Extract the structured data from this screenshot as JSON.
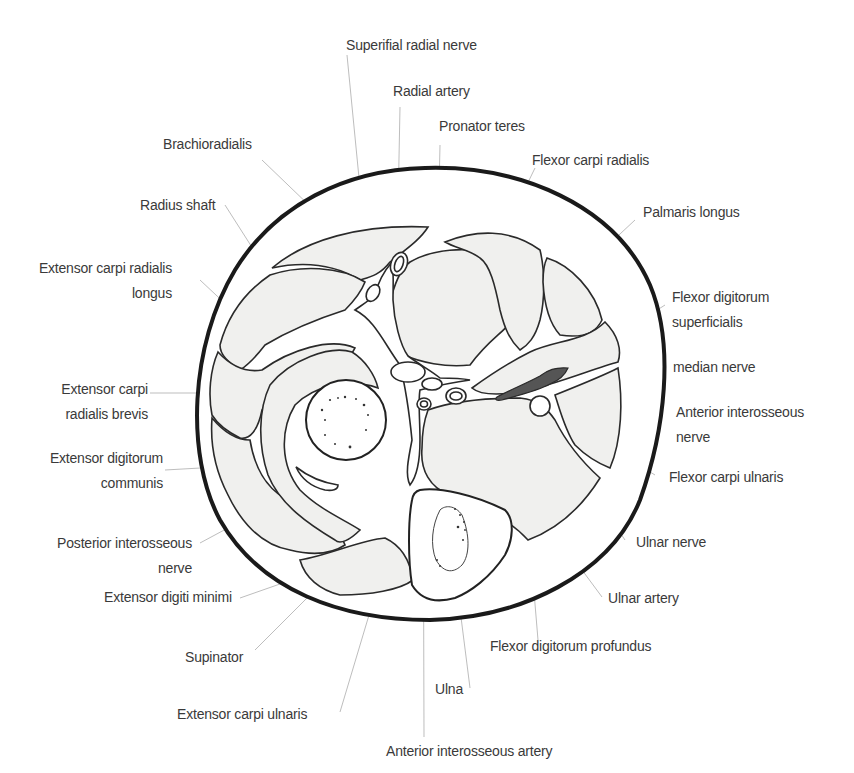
{
  "figure": {
    "type": "anatomical cross-section",
    "colors": {
      "outline": "#2a2a2a",
      "muscle_fill": "#f0f0ee",
      "label_text": "#3a3a3a",
      "leader_line": "#b5b5b5",
      "background": "#ffffff"
    }
  },
  "labels": {
    "superficial_radial_nerve": [
      "Superifial radial nerve"
    ],
    "radial_artery": [
      "Radial artery"
    ],
    "pronator_teres": [
      "Pronator teres"
    ],
    "brachioradialis": [
      "Brachioradialis"
    ],
    "flexor_carpi_radialis": [
      "Flexor carpi radialis"
    ],
    "radius_shaft": [
      "Radius shaft"
    ],
    "palmaris_longus": [
      "Palmaris longus"
    ],
    "ecrl": [
      "Extensor carpi radialis",
      "longus"
    ],
    "fds": [
      "Flexor digitorum",
      "superficialis"
    ],
    "median_nerve": [
      "median nerve"
    ],
    "ecrb": [
      "Extensor carpi",
      "radialis brevis"
    ],
    "anterior_interosseous_nerve": [
      "Anterior interosseous",
      "nerve"
    ],
    "edc": [
      "Extensor digitorum",
      "communis"
    ],
    "flexor_carpi_ulnaris": [
      "Flexor carpi ulnaris"
    ],
    "posterior_interosseous_nerve": [
      "Posterior interosseous",
      "nerve"
    ],
    "ulnar_nerve": [
      "Ulnar nerve"
    ],
    "extensor_digiti_minimi": [
      "Extensor digiti minimi"
    ],
    "ulnar_artery": [
      "Ulnar artery"
    ],
    "supinator": [
      "Supinator"
    ],
    "fdp": [
      "Flexor digitorum profundus"
    ],
    "ulna": [
      "Ulna"
    ],
    "extensor_carpi_ulnaris": [
      "Extensor carpi ulnaris"
    ],
    "anterior_interosseous_artery": [
      "Anterior interosseous artery"
    ]
  }
}
